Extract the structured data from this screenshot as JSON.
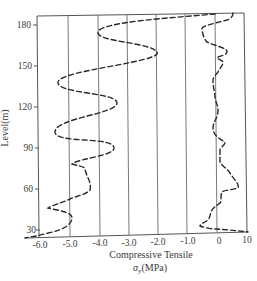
{
  "chart_data": {
    "type": "line",
    "title": "",
    "xlabel_line1": "Compressive Tensile",
    "xlabel_line2": "σ_y(MPa)",
    "xlabel_sigma": "σ",
    "xlabel_sub": "y",
    "xlabel_unit": "(MPa)",
    "ylabel": "Level(m)",
    "x_ticks": [
      "-6.0",
      "-5.0",
      "-4.0",
      "-3.0",
      "-2.0",
      "-1.0",
      "0",
      "10"
    ],
    "y_ticks": [
      "180",
      "150",
      "120",
      "90",
      "60",
      "30"
    ],
    "ylim": [
      25,
      190
    ],
    "grid": "vertical lines only",
    "legend": "none",
    "series": [
      {
        "name": "Compressive stress profile (left curve)",
        "style": "dashed",
        "points": [
          {
            "sigma": 0.0,
            "level": 190
          },
          {
            "sigma": -4.1,
            "level": 175
          },
          {
            "sigma": -2.0,
            "level": 160
          },
          {
            "sigma": -5.4,
            "level": 138
          },
          {
            "sigma": -3.4,
            "level": 123
          },
          {
            "sigma": -5.5,
            "level": 102
          },
          {
            "sigma": -3.5,
            "level": 90
          },
          {
            "sigma": -4.9,
            "level": 78
          },
          {
            "sigma": -4.5,
            "level": 75
          },
          {
            "sigma": -4.3,
            "level": 59
          },
          {
            "sigma": -5.0,
            "level": 53
          },
          {
            "sigma": -5.7,
            "level": 46
          },
          {
            "sigma": -4.9,
            "level": 39
          },
          {
            "sigma": -5.7,
            "level": 28
          },
          {
            "sigma": -6.5,
            "level": 24
          }
        ]
      },
      {
        "name": "Tensile stress profile (right curve)",
        "style": "dashed",
        "points": [
          {
            "sigma": 5.5,
            "level": 190
          },
          {
            "sigma": -0.5,
            "level": 173
          },
          {
            "sigma": 3.5,
            "level": 165
          },
          {
            "sigma": 0.0,
            "level": 161
          },
          {
            "sigma": 2.0,
            "level": 157
          },
          {
            "sigma": 0.3,
            "level": 150
          },
          {
            "sigma": -0.2,
            "level": 144
          },
          {
            "sigma": -0.1,
            "level": 132
          },
          {
            "sigma": 0.3,
            "level": 122
          },
          {
            "sigma": -0.2,
            "level": 110
          },
          {
            "sigma": -0.1,
            "level": 105
          },
          {
            "sigma": -0.2,
            "level": 99
          },
          {
            "sigma": 2.8,
            "level": 90
          },
          {
            "sigma": 1.0,
            "level": 84
          },
          {
            "sigma": 1.0,
            "level": 75
          },
          {
            "sigma": 4.5,
            "level": 67
          },
          {
            "sigma": 7.3,
            "level": 56
          },
          {
            "sigma": 1.7,
            "level": 53
          },
          {
            "sigma": 1.0,
            "level": 45
          },
          {
            "sigma": -0.2,
            "level": 40
          },
          {
            "sigma": -0.4,
            "level": 33
          },
          {
            "sigma": -0.6,
            "level": 28
          },
          {
            "sigma": 0.0,
            "level": 26
          },
          {
            "sigma": 10.0,
            "level": 24
          }
        ]
      }
    ],
    "render": {
      "frame": {
        "tl": [
          37,
          16
        ],
        "tr": [
          244,
          13
        ],
        "bl": [
          25,
          238
        ],
        "br": [
          248,
          232
        ]
      },
      "gridlines_x": [
        70,
        100,
        129,
        158,
        187,
        217
      ],
      "tick_label_x": [
        40,
        70,
        100,
        129,
        158,
        188,
        218,
        246
      ],
      "tick_label_y_pos": [
        25,
        66,
        107,
        148,
        189,
        230
      ],
      "left_path": "M 215 14 C 170 18, 100 22, 98 32 C 96 42, 150 42, 157 52 C 164 62, 60 70, 58 82 C 56 94, 117 92, 117 103 C 117 114, 55 118, 55 132 C 55 144, 114 136, 114 148 C 114 156, 80 158, 72 164 C 78 166, 84 166, 85 169 C 86 176, 92 182, 90 190 C 86 195, 76 196, 70 199 C 62 203, 52 205, 48 208 C 60 211, 72 212, 72 218 C 72 224, 64 230, 48 233 C 38 236, 30 237, 25 238",
      "right_path": "M 233 13 C 233 18, 228 20, 227 20 C 212 24, 200 26, 202 30 C 203 36, 205 40, 207 42 C 215 46, 228 48, 227 52 C 226 56, 218 56, 217 58 C 220 60, 224 61, 223 63 C 222 67, 219 69, 218 72 C 215 76, 213 78, 213 80 C 213 88, 215 92, 215 97 C 216 103, 218 106, 218 110 C 218 118, 214 120, 213 127 C 213 132, 214 136, 225 142 C 225 146, 220 147, 220 150 C 220 156, 220 160, 220 163 C 224 167, 228 170, 230 173 C 234 180, 240 184, 238 188 C 232 190, 224 190, 222 192 C 220 196, 222 200, 220 203 C 216 206, 213 208, 212 210 C 210 214, 210 218, 208 220 C 204 223, 200 224, 200 226 C 205 228, 212 229, 217 229 C 230 230, 240 231, 248 232"
    }
  }
}
